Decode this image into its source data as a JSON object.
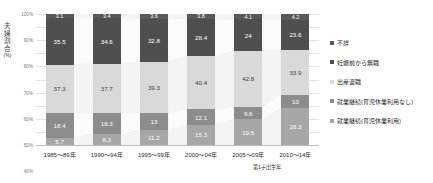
{
  "chart_data": {
    "type": "bar",
    "stacked": true,
    "normalized_percent": true,
    "title": "",
    "subtitle": "",
    "xlabel": "第1子出生年",
    "ylabel": "夫婦割合(%)",
    "ylim": [
      0,
      100
    ],
    "ytick_labels": [
      "100%",
      "90%",
      "80%",
      "70%",
      "60%",
      "50%",
      "40%",
      "30%",
      "20%",
      "10%",
      "0%"
    ],
    "ytick_values": [
      100,
      90,
      80,
      70,
      60,
      50,
      40,
      30,
      20,
      10,
      0
    ],
    "grid": true,
    "legend_position": "right",
    "categories": [
      "1985〜89年",
      "1990〜94年",
      "1995〜99年",
      "2000〜04年",
      "2005〜09年",
      "2010〜14年"
    ],
    "series": [
      {
        "name": "不詳",
        "color": "#595959",
        "values": [
          3.1,
          3.4,
          3.6,
          3.8,
          4.1,
          4.2
        ],
        "labels": [
          "3.1",
          "3.4",
          "3.6",
          "3.8",
          "4.1",
          "4.2"
        ]
      },
      {
        "name": "妊娠前から無職",
        "color": "#4f4f4f",
        "values": [
          35.5,
          34.6,
          32.8,
          28.4,
          24.0,
          23.6
        ],
        "labels": [
          "35.5",
          "34.6",
          "32.8",
          "28.4",
          "24",
          "23.6"
        ]
      },
      {
        "name": "出産退職",
        "color": "#d9d9d9",
        "values": [
          37.3,
          37.7,
          39.3,
          40.4,
          42.8,
          33.9
        ],
        "labels": [
          "37.3",
          "37.7",
          "39.3",
          "40.4",
          "42.8",
          "33.9"
        ]
      },
      {
        "name": "就業継続(育児休業利用なし)",
        "color": "#8c8c8c",
        "values": [
          18.4,
          16.3,
          13.0,
          12.1,
          9.6,
          10.0
        ],
        "labels": [
          "18.4",
          "16.3",
          "13",
          "12.1",
          "9.6",
          "10"
        ]
      },
      {
        "name": "就業継続(育児休業利用)",
        "color": "#a6a6a6",
        "values": [
          5.7,
          8.3,
          11.2,
          15.3,
          19.5,
          28.3
        ],
        "labels": [
          "5.7",
          "8.3",
          "11.2",
          "15.3",
          "19.5",
          "28.3"
        ]
      }
    ]
  },
  "axes": {
    "y_title_chars": [
      "夫",
      "婦",
      "割",
      "合",
      "(%)"
    ],
    "x_title": "第1子出生年"
  },
  "colors": {
    "grid": "#e3e3e3",
    "axis": "#bdbdbd",
    "text": "#2b2b2b",
    "tick_text": "#7a7a7a",
    "ribbon": "#eeeeee"
  }
}
